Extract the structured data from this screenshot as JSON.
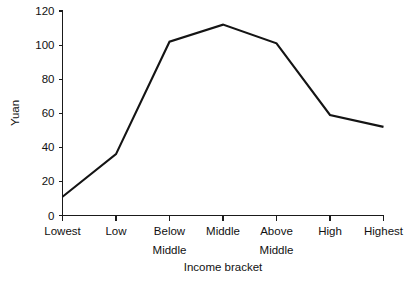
{
  "chart_data": {
    "type": "line",
    "title": "",
    "title_note": "partially cropped above top edge",
    "categories": [
      "Lowest",
      "Low",
      "Below Middle",
      "Middle",
      "Above Middle",
      "High",
      "Highest"
    ],
    "category_lines": [
      [
        "Lowest"
      ],
      [
        "Low"
      ],
      [
        "Below",
        "Middle"
      ],
      [
        "Middle"
      ],
      [
        "Above",
        "Middle"
      ],
      [
        "High"
      ],
      [
        "Highest"
      ]
    ],
    "values": [
      11,
      36,
      102,
      112,
      101,
      59,
      52
    ],
    "xlabel": "Income bracket",
    "ylabel": "Yuan",
    "ylim": [
      0,
      120
    ],
    "yticks": [
      0,
      20,
      40,
      60,
      80,
      100,
      120
    ],
    "ytick_labels": [
      "0",
      "20",
      "40",
      "60",
      "80",
      "100",
      "120"
    ],
    "grid": false,
    "legend": false,
    "legend_position": "none",
    "series": [
      {
        "name": "Yuan",
        "values": [
          11,
          36,
          102,
          112,
          101,
          59,
          52
        ],
        "color": "#141414"
      }
    ]
  },
  "style": {
    "background": "#ffffff",
    "line_color": "#141414",
    "axis_color": "#1a1a1a",
    "text_color": "#111111"
  }
}
